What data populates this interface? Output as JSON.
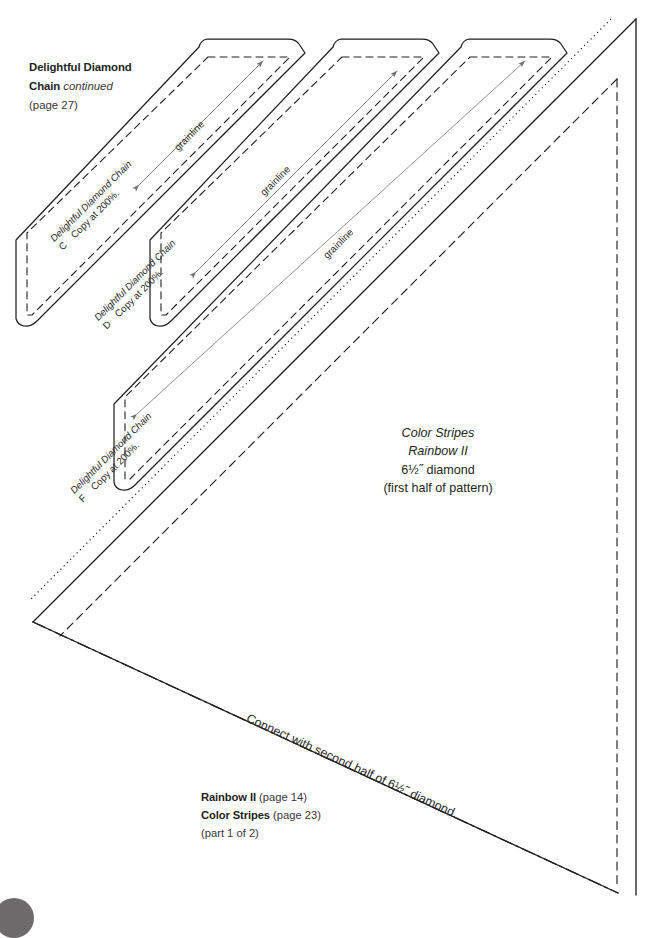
{
  "page": {
    "background_color": "#ffffff",
    "ink_color": "#231f20",
    "grainline_color": "#8b8b8b"
  },
  "header": {
    "line1_bold": "Delightful Diamond",
    "line2_bold": "Chain",
    "line2_italic": "continued",
    "line3": "(page 27)"
  },
  "center": {
    "line1": "Color Stripes",
    "line2": "Rainbow II",
    "line3": "6½˝ diamond",
    "line4": "(first half of pattern)"
  },
  "footer": {
    "line1_bold": "Rainbow II",
    "line1_rest": "(page 14)",
    "line2_bold": "Color Stripes",
    "line2_rest": "(page 23)",
    "line3": "(part 1 of 2)"
  },
  "connect_note": "Connect with second half of 6½˝ diamond.",
  "strips": [
    {
      "id": "strip-c",
      "title": "Delightful Diamond Chain",
      "letter": "C",
      "instruction": "Copy at 200%.",
      "grainline_label": "grainline"
    },
    {
      "id": "strip-d",
      "title": "Delightful Diamond Chain",
      "letter": "D",
      "instruction": "Copy at 200%.",
      "grainline_label": "grainline"
    },
    {
      "id": "strip-f",
      "title": "Delightful Diamond Chain",
      "letter": "F",
      "instruction": "Copy at 200%.",
      "grainline_label": "grainline"
    }
  ],
  "line_legend": {
    "cutting_line": "solid",
    "seam_line": "dashed",
    "join_line": "dash-dot",
    "alignment_line": "dotted"
  }
}
